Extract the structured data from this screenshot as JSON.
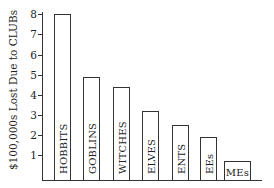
{
  "chart_data": {
    "type": "bar",
    "title": "",
    "xlabel": "",
    "ylabel": "$100,000s Lost Due to CLUBs",
    "ylim": [
      0,
      8
    ],
    "yticks": [
      1,
      2,
      3,
      4,
      5,
      6,
      7,
      8
    ],
    "grid": false,
    "legend": null,
    "categories": [
      "HOBBITS",
      "GOBLINS",
      "WITCHES",
      "ELVES",
      "ENTS",
      "EEs",
      "MEs"
    ],
    "values": [
      8.0,
      4.9,
      4.4,
      3.2,
      2.5,
      1.9,
      0.7
    ],
    "bar_labels_inside": true
  }
}
